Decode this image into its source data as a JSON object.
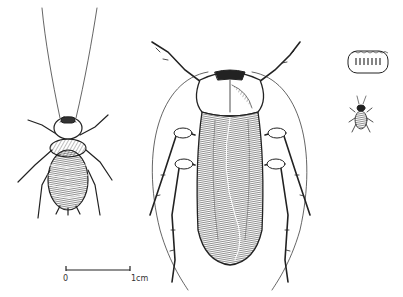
{
  "figure": {
    "specimens": [
      {
        "id": "nymph",
        "label": "nymph (dorsal view)"
      },
      {
        "id": "adult",
        "label": "adult (dorsal view)"
      },
      {
        "id": "ootheca",
        "label": "egg case"
      },
      {
        "id": "hatchling",
        "label": "first-instar nymph"
      }
    ],
    "scale_bar": {
      "start_label": "0",
      "end_label": "1cm"
    }
  }
}
